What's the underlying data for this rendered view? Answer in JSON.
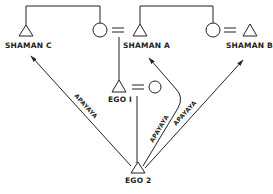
{
  "diagram": {
    "type": "kinship-diagram",
    "nodes": {
      "shaman_c": {
        "label": "SHAMAN C",
        "symbol": "triangle"
      },
      "shaman_a": {
        "label": "SHAMAN A",
        "symbol": "triangle"
      },
      "shaman_b": {
        "label": "SHAMAN B",
        "symbol": "triangle"
      },
      "ego1": {
        "label": "EGO I",
        "symbol": "triangle"
      },
      "ego2": {
        "label": "EGO 2",
        "symbol": "triangle"
      }
    },
    "edges": {
      "to_shaman_c": {
        "label": "APAYAYA"
      },
      "to_shaman_a": {
        "label": "APAYAYA"
      },
      "to_shaman_b": {
        "label": "APAYAYA"
      }
    },
    "colors": {
      "line": "#222222",
      "background": "#ffffff"
    }
  }
}
